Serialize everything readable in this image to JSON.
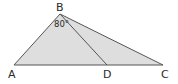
{
  "diagram": {
    "type": "triangle",
    "points": {
      "A": {
        "label": "A",
        "x": 14,
        "y": 65
      },
      "B": {
        "label": "B",
        "x": 60,
        "y": 14
      },
      "C": {
        "label": "C",
        "x": 163,
        "y": 65
      },
      "D": {
        "label": "D",
        "x": 107,
        "y": 65
      }
    },
    "segments": [
      "AB",
      "BC",
      "AC",
      "BD"
    ],
    "angle_label": "80°",
    "angle_at": "ABD",
    "colors": {
      "fill": "#dedede",
      "stroke": "#555555",
      "text": "#2a2a2a"
    }
  }
}
